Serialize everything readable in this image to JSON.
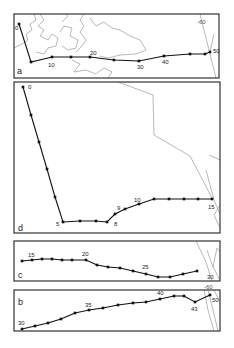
{
  "figure": {
    "panels": [
      {
        "id": "a",
        "label": "a",
        "frame": [
          14,
          14,
          205,
          64
        ],
        "label_pos": [
          17,
          74
        ],
        "track": [
          [
            19,
            24
          ],
          [
            31,
            62
          ],
          [
            52,
            57
          ],
          [
            71,
            57
          ],
          [
            90,
            57
          ],
          [
            114,
            60
          ],
          [
            139,
            61
          ],
          [
            164,
            56
          ],
          [
            190,
            54
          ],
          [
            205,
            54
          ],
          [
            210,
            52
          ]
        ],
        "point_labels": [
          {
            "text": "0",
            "x": 15,
            "y": 30
          },
          {
            "text": "10",
            "x": 48,
            "y": 67
          },
          {
            "text": "20",
            "x": 90,
            "y": 55
          },
          {
            "text": "30",
            "x": 137,
            "y": 69
          },
          {
            "text": "40",
            "x": 162,
            "y": 64
          },
          {
            "text": "50",
            "x": 213,
            "y": 53
          }
        ],
        "contour_labels": [
          {
            "text": "-60",
            "x": 197,
            "y": 24
          }
        ],
        "contours": [
          [
            [
              14,
              48
            ],
            [
              22,
              44
            ],
            [
              28,
              40
            ],
            [
              26,
              34
            ],
            [
              32,
              30
            ],
            [
              30,
              24
            ],
            [
              36,
              20
            ],
            [
              34,
              14
            ]
          ],
          [
            [
              40,
              14
            ],
            [
              44,
              20
            ],
            [
              38,
              26
            ],
            [
              44,
              30
            ],
            [
              40,
              36
            ],
            [
              48,
              40
            ],
            [
              52,
              34
            ],
            [
              58,
              38
            ],
            [
              56,
              46
            ],
            [
              48,
              48
            ],
            [
              44,
              54
            ],
            [
              36,
              52
            ]
          ],
          [
            [
              60,
              32
            ],
            [
              64,
              26
            ],
            [
              72,
              28
            ],
            [
              70,
              36
            ],
            [
              78,
              40
            ],
            [
              76,
              48
            ],
            [
              68,
              50
            ],
            [
              62,
              46
            ]
          ],
          [
            [
              62,
              22
            ],
            [
              68,
              16
            ],
            [
              66,
              14
            ]
          ],
          [
            [
              84,
              14
            ],
            [
              80,
              20
            ],
            [
              84,
              26
            ],
            [
              80,
              32
            ],
            [
              86,
              40
            ],
            [
              82,
              46
            ],
            [
              76,
              52
            ]
          ],
          [
            [
              90,
              18
            ],
            [
              96,
              26
            ],
            [
              104,
              22
            ],
            [
              112,
              28
            ],
            [
              120,
              30
            ],
            [
              130,
              36
            ],
            [
              140,
              40
            ],
            [
              146,
              50
            ],
            [
              136,
              54
            ],
            [
              120,
              55
            ],
            [
              108,
              58
            ],
            [
              100,
              56
            ]
          ],
          [
            [
              72,
              60
            ],
            [
              80,
              64
            ],
            [
              74,
              72
            ],
            [
              86,
              70
            ],
            [
              96,
              74
            ],
            [
              104,
              68
            ],
            [
              112,
              72
            ],
            [
              108,
              78
            ]
          ],
          [
            [
              200,
              14
            ],
            [
              204,
              30
            ],
            [
              208,
              46
            ],
            [
              212,
              62
            ],
            [
              216,
              78
            ]
          ],
          [
            [
              210,
              52
            ],
            [
              214,
              34
            ]
          ]
        ]
      },
      {
        "id": "d",
        "label": "d",
        "frame": [
          14,
          82,
          206,
          151
        ],
        "label_pos": [
          18,
          231
        ],
        "track": [
          [
            23,
            87
          ],
          [
            31,
            115
          ],
          [
            39,
            142
          ],
          [
            47,
            169
          ],
          [
            55,
            197
          ],
          [
            63,
            222
          ],
          [
            80,
            221
          ],
          [
            96,
            221
          ],
          [
            107,
            222
          ],
          [
            115,
            214
          ],
          [
            125,
            209
          ],
          [
            139,
            204
          ],
          [
            154,
            199
          ],
          [
            169,
            199
          ],
          [
            184,
            199
          ],
          [
            198,
            199
          ],
          [
            212,
            199
          ]
        ],
        "point_labels": [
          {
            "text": "0",
            "x": 28,
            "y": 89
          },
          {
            "text": "5",
            "x": 56,
            "y": 226
          },
          {
            "text": "8",
            "x": 114,
            "y": 226
          },
          {
            "text": "9",
            "x": 117,
            "y": 210
          },
          {
            "text": "10",
            "x": 134,
            "y": 202
          },
          {
            "text": "15",
            "x": 208,
            "y": 209
          }
        ],
        "contour_labels": [],
        "contours": [
          [
            [
              118,
              82
            ],
            [
              153,
              95
            ],
            [
              154,
              135
            ],
            [
              190,
              156
            ],
            [
              212,
              198
            ]
          ],
          [
            [
              209,
              155
            ],
            [
              220,
              160
            ]
          ],
          [
            [
              206,
              170
            ],
            [
              214,
              200
            ],
            [
              220,
              214
            ]
          ],
          [
            [
              220,
              228
            ],
            [
              214,
              215
            ],
            [
              220,
              205
            ]
          ]
        ]
      },
      {
        "id": "c",
        "label": "c",
        "frame": [
          14,
          241,
          206,
          40
        ],
        "label_pos": [
          18,
          278
        ],
        "track": [
          [
            22,
            261
          ],
          [
            32,
            260
          ],
          [
            42,
            259
          ],
          [
            52,
            259
          ],
          [
            62,
            260
          ],
          [
            72,
            260
          ],
          [
            86,
            260
          ],
          [
            97,
            265
          ],
          [
            108,
            267
          ],
          [
            120,
            268
          ],
          [
            133,
            271
          ],
          [
            146,
            274
          ],
          [
            158,
            277
          ],
          [
            170,
            277
          ],
          [
            183,
            274
          ],
          [
            197,
            271
          ]
        ],
        "point_labels": [
          {
            "text": "15",
            "x": 28,
            "y": 257
          },
          {
            "text": "20",
            "x": 82,
            "y": 256
          },
          {
            "text": "25",
            "x": 142,
            "y": 269
          },
          {
            "text": "30",
            "x": 207,
            "y": 279
          }
        ],
        "contour_labels": [],
        "contours": [
          [
            [
              196,
              241
            ],
            [
              206,
              262
            ],
            [
              212,
              281
            ]
          ],
          [
            [
              207,
              250
            ],
            [
              213,
              267
            ],
            [
              217,
              248
            ],
            [
              220,
              252
            ]
          ],
          [
            [
              213,
              266
            ],
            [
              220,
              281
            ]
          ]
        ]
      },
      {
        "id": "b",
        "label": "b",
        "frame": [
          14,
          290,
          206,
          41
        ],
        "label_pos": [
          18,
          305
        ],
        "track": [
          [
            22,
            329
          ],
          [
            35,
            326
          ],
          [
            48,
            323
          ],
          [
            61,
            319
          ],
          [
            75,
            313
          ],
          [
            89,
            310
          ],
          [
            103,
            308
          ],
          [
            118,
            305
          ],
          [
            133,
            303
          ],
          [
            146,
            302
          ],
          [
            160,
            299
          ],
          [
            174,
            296
          ],
          [
            184,
            296
          ],
          [
            195,
            302
          ],
          [
            210,
            295
          ]
        ],
        "point_labels": [
          {
            "text": "30",
            "x": 18,
            "y": 325
          },
          {
            "text": "35",
            "x": 85,
            "y": 307
          },
          {
            "text": "40",
            "x": 157,
            "y": 295
          },
          {
            "text": "43",
            "x": 191,
            "y": 311
          },
          {
            "text": "50",
            "x": 212,
            "y": 302
          }
        ],
        "contour_labels": [
          {
            "text": "-60",
            "x": 204,
            "y": 289
          }
        ],
        "contours": [
          [
            [
              204,
              290
            ],
            [
              208,
              310
            ],
            [
              214,
              331
            ]
          ],
          [
            [
              208,
              290
            ],
            [
              213,
              310
            ],
            [
              218,
              331
            ]
          ],
          [
            [
              214,
              290
            ],
            [
              220,
              302
            ]
          ]
        ]
      }
    ]
  }
}
